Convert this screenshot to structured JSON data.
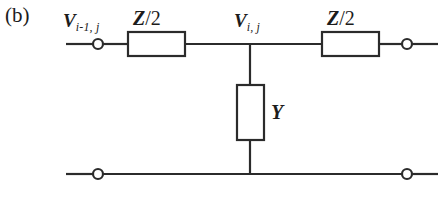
{
  "figure": {
    "panel_label": "(b)",
    "background_color": "#ffffff",
    "line_color": "#2b2b2b",
    "width": 438,
    "height": 197
  },
  "labels": {
    "voltage_left_symbol": "V",
    "voltage_left_subscript": "i-1, j",
    "voltage_mid_symbol": "V",
    "voltage_mid_subscript": "i, j",
    "impedance_left_symbol": "Z",
    "impedance_left_divisor": "/2",
    "impedance_right_symbol": "Z",
    "impedance_right_divisor": "/2",
    "admittance_symbol": "Y"
  },
  "circuit": {
    "type": "two-port-T-network",
    "top_rail_y": 44,
    "bottom_rail_y": 174,
    "shunt_branch_x": 250,
    "components": [
      {
        "name": "series-impedance-left",
        "label": "Z/2",
        "orientation": "horizontal",
        "x": 128,
        "y": 32,
        "width": 57,
        "height": 24
      },
      {
        "name": "series-impedance-right",
        "label": "Z/2",
        "orientation": "horizontal",
        "x": 322,
        "y": 32,
        "width": 57,
        "height": 24
      },
      {
        "name": "shunt-admittance",
        "label": "Y",
        "orientation": "vertical",
        "x": 237,
        "y": 85,
        "width": 27,
        "height": 55
      }
    ],
    "terminals": [
      {
        "name": "terminal-top-left",
        "x": 98,
        "y": 44,
        "radius": 5
      },
      {
        "name": "terminal-top-right",
        "x": 407,
        "y": 44,
        "radius": 5
      },
      {
        "name": "terminal-bottom-left",
        "x": 98,
        "y": 174,
        "radius": 5
      },
      {
        "name": "terminal-bottom-right",
        "x": 407,
        "y": 174,
        "radius": 5
      }
    ]
  }
}
